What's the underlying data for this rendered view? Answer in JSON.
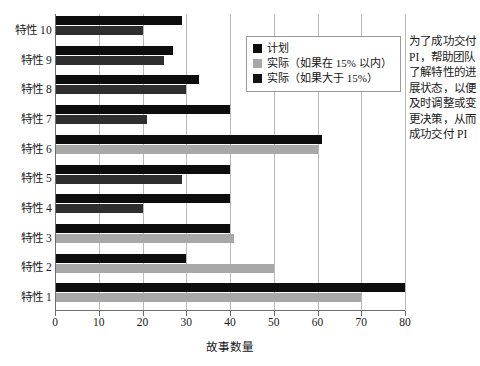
{
  "chart_data": {
    "type": "bar",
    "orientation": "horizontal",
    "title": "",
    "xlabel": "故事数量",
    "ylabel": "",
    "xlim": [
      0,
      80
    ],
    "xticks": [
      0,
      10,
      20,
      30,
      40,
      50,
      60,
      70,
      80
    ],
    "grid": "vertical",
    "legend_position": "upper-center",
    "categories": [
      "特性 1",
      "特性 2",
      "特性 3",
      "特性 4",
      "特性 5",
      "特性 6",
      "特性 7",
      "特性 8",
      "特性 9",
      "特性 10"
    ],
    "series": [
      {
        "name": "计划",
        "key": "plan",
        "color": "#0d0d0d",
        "values": [
          80,
          30,
          40,
          40,
          40,
          61,
          40,
          33,
          27,
          29
        ]
      },
      {
        "name": "实际",
        "key": "actual",
        "values": [
          70,
          50,
          41,
          20,
          29,
          60,
          21,
          30,
          25,
          20
        ],
        "severity": [
          "ok",
          "ok",
          "ok",
          "late",
          "late",
          "ok",
          "late",
          "late",
          "late",
          "late"
        ],
        "color_ok": "#a8a8a8",
        "color_late": "#2e2e2e"
      }
    ],
    "legend": [
      {
        "label": "计划",
        "swatch": "#0d0d0d"
      },
      {
        "label": "实际（如果在 15% 以内）",
        "swatch": "#a8a8a8"
      },
      {
        "label": "实际（如果大于 15%）",
        "swatch": "#141414"
      }
    ]
  },
  "sidenote": {
    "text": "为了成功交付 PI，帮助团队了解特性的进展状态，以便及时调整或变更决策，从而成功交付 PI"
  }
}
